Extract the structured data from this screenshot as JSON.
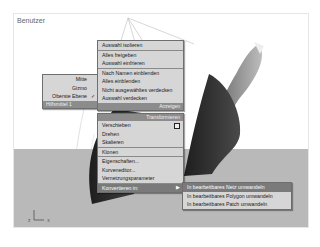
{
  "viewport": {
    "label": "Benutzer",
    "axis_z": "z",
    "axis_x": "x"
  },
  "main_menu": {
    "section1": [
      "Auswahl isolieren",
      "Alles freigeben",
      "Auswahl einfrieren"
    ],
    "section2": [
      "Nach Namen einblenden",
      "Alles einblenden",
      "Nicht ausgewähltes verdecken",
      "Auswahl verdecken"
    ],
    "header_anzeigen": "Anzeigen",
    "header_transformieren": "Transformieren",
    "section3": [
      "Verschieben",
      "Drehen",
      "Skalieren"
    ],
    "section4": [
      "Klonen"
    ],
    "section5": [
      "Eigenschaften...",
      "Kurveneditor...",
      "Vernetzungsparameter"
    ],
    "convert_item": "Konvertieren in:",
    "convert_arrow": "▶"
  },
  "left_menu": {
    "items": [
      "Mitte",
      "Gizmo",
      "Oberste Ebene"
    ],
    "checked_index": 2,
    "check_glyph": "✓",
    "header": "Hilfsmittel 1"
  },
  "submenu": {
    "items": [
      "In bearbeitbares Netz umwandeln",
      "In bearbeitbares Polygon umwandeln",
      "In bearbeitbares Patch umwandeln"
    ],
    "highlighted_index": 0
  }
}
